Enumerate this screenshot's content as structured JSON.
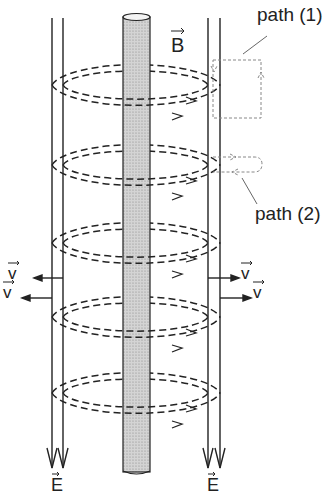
{
  "diagram": {
    "labels": {
      "path1": "path (1)",
      "path2": "path (2)",
      "B": "B",
      "v": "v",
      "E": "E"
    },
    "colors": {
      "ink": "#222222",
      "rod_fill": "#c8c8c8",
      "path_dash": "#888888"
    },
    "field_loops": [
      85,
      165,
      243,
      317,
      393
    ]
  }
}
